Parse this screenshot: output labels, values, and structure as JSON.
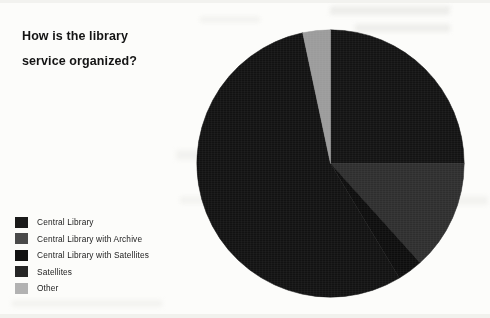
{
  "title": {
    "line1": "How is the library",
    "line2": "service organized?"
  },
  "chart_data": {
    "type": "pie",
    "title": "How is the library service organized?",
    "xlabel": "",
    "ylabel": "",
    "legend_position": "bottom-left",
    "grid": false,
    "start_angle_deg": 0,
    "direction": "clockwise",
    "categories": [
      "Central Library",
      "Central Library with Archive",
      "Central Library with Satellites",
      "Satellites",
      "Other"
    ],
    "values": [
      25,
      13.3,
      3,
      55.2,
      3.5
    ],
    "slices": [
      {
        "label": "Central Library",
        "percent": 25,
        "angle_deg": 90,
        "color": "#131313",
        "start_deg": 0,
        "end_deg": 90
      },
      {
        "label": "Central Library with Archive",
        "percent": 13.3,
        "angle_deg": 48,
        "color": "#2e2e2e",
        "start_deg": 90,
        "end_deg": 138
      },
      {
        "label": "Central Library with Satellites",
        "percent": 3,
        "angle_deg": 11,
        "color": "#0d0d0d",
        "start_deg": 138,
        "end_deg": 149
      },
      {
        "label": "Satellites",
        "percent": 55.2,
        "angle_deg": 199,
        "color": "#121212",
        "start_deg": 149,
        "end_deg": 348
      },
      {
        "label": "Other",
        "percent": 3.5,
        "angle_deg": 12,
        "color": "#9b9b9b",
        "start_deg": 348,
        "end_deg": 360
      }
    ]
  },
  "legend": {
    "items": [
      {
        "label": "Central Library",
        "color": "#1a1a1a"
      },
      {
        "label": "Central Library with Archive",
        "color": "#4a4a4a"
      },
      {
        "label": "Central Library with Satellites",
        "color": "#111111"
      },
      {
        "label": "Satellites",
        "color": "#262626"
      },
      {
        "label": "Other",
        "color": "#b2b2b2"
      }
    ]
  }
}
